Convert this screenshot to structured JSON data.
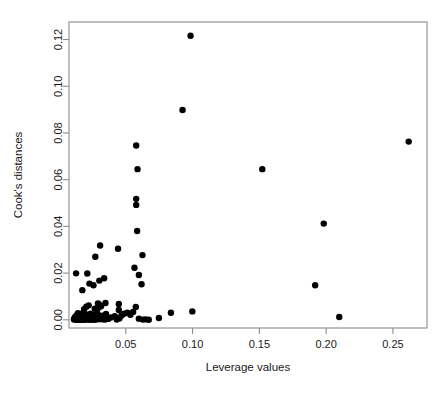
{
  "chart_data": {
    "type": "scatter",
    "title": "",
    "xlabel": "Leverage values",
    "ylabel": "Cook's distances",
    "xlim": [
      0.0075,
      0.2755
    ],
    "ylim": [
      -0.0035,
      0.1275
    ],
    "xticks": [
      0.05,
      0.1,
      0.15,
      0.2,
      0.25
    ],
    "xticklabels": [
      "0.05",
      "0.10",
      "0.15",
      "0.20",
      "0.25"
    ],
    "yticks": [
      0.0,
      0.02,
      0.04,
      0.06,
      0.08,
      0.1,
      0.12
    ],
    "yticklabels": [
      "0.00",
      "0.02",
      "0.04",
      "0.06",
      "0.08",
      "0.10",
      "0.12"
    ],
    "grid": false,
    "legend": null,
    "marker": "filled-circle",
    "marker_color": "#000000",
    "marker_size": 3.2,
    "series": [
      {
        "name": "observations",
        "points": [
          [
            0.0985,
            0.1216
          ],
          [
            0.0925,
            0.0898
          ],
          [
            0.2618,
            0.0763
          ],
          [
            0.0578,
            0.0746
          ],
          [
            0.1522,
            0.0645
          ],
          [
            0.0588,
            0.0645
          ],
          [
            0.0578,
            0.0518
          ],
          [
            0.0578,
            0.0492
          ],
          [
            0.1982,
            0.0412
          ],
          [
            0.0585,
            0.038
          ],
          [
            0.0308,
            0.0318
          ],
          [
            0.0442,
            0.0304
          ],
          [
            0.0625,
            0.0277
          ],
          [
            0.0272,
            0.027
          ],
          [
            0.0565,
            0.0223
          ],
          [
            0.0128,
            0.0199
          ],
          [
            0.0212,
            0.0198
          ],
          [
            0.0598,
            0.0192
          ],
          [
            0.0338,
            0.0178
          ],
          [
            0.0302,
            0.0168
          ],
          [
            0.0228,
            0.0155
          ],
          [
            0.0618,
            0.0152
          ],
          [
            0.0258,
            0.0148
          ],
          [
            0.1918,
            0.0148
          ],
          [
            0.0175,
            0.0127
          ],
          [
            0.0348,
            0.0072
          ],
          [
            0.0292,
            0.007
          ],
          [
            0.0448,
            0.0068
          ],
          [
            0.0302,
            0.0065
          ],
          [
            0.0222,
            0.0062
          ],
          [
            0.0315,
            0.0058
          ],
          [
            0.0205,
            0.0056
          ],
          [
            0.0575,
            0.0055
          ],
          [
            0.0295,
            0.0052
          ],
          [
            0.0268,
            0.0048
          ],
          [
            0.0188,
            0.0046
          ],
          [
            0.0448,
            0.0042
          ],
          [
            0.0998,
            0.0036
          ],
          [
            0.0555,
            0.0034
          ],
          [
            0.0838,
            0.003
          ],
          [
            0.0512,
            0.003
          ],
          [
            0.0285,
            0.0029
          ],
          [
            0.0178,
            0.0028
          ],
          [
            0.0142,
            0.0028
          ],
          [
            0.0488,
            0.0026
          ],
          [
            0.0238,
            0.0026
          ],
          [
            0.0352,
            0.0025
          ],
          [
            0.0162,
            0.0024
          ],
          [
            0.0208,
            0.0023
          ],
          [
            0.0252,
            0.0022
          ],
          [
            0.0535,
            0.0022
          ],
          [
            0.0135,
            0.0021
          ],
          [
            0.0295,
            0.002
          ],
          [
            0.0185,
            0.002
          ],
          [
            0.0468,
            0.0019
          ],
          [
            0.0228,
            0.0018
          ],
          [
            0.0325,
            0.0018
          ],
          [
            0.0155,
            0.0017
          ],
          [
            0.0275,
            0.0016
          ],
          [
            0.0198,
            0.0016
          ],
          [
            0.0128,
            0.0015
          ],
          [
            0.0418,
            0.0015
          ],
          [
            0.0242,
            0.0014
          ],
          [
            0.0172,
            0.0014
          ],
          [
            0.0308,
            0.0013
          ],
          [
            0.0145,
            0.0013
          ],
          [
            0.0215,
            0.0012
          ],
          [
            0.2098,
            0.0012
          ],
          [
            0.0262,
            0.0011
          ],
          [
            0.0348,
            0.0011
          ],
          [
            0.0118,
            0.001
          ],
          [
            0.0192,
            0.001
          ],
          [
            0.0388,
            0.001
          ],
          [
            0.0232,
            0.0009
          ],
          [
            0.0158,
            0.0009
          ],
          [
            0.0285,
            0.0008
          ],
          [
            0.0128,
            0.0008
          ],
          [
            0.0205,
            0.0008
          ],
          [
            0.0748,
            0.0008
          ],
          [
            0.0338,
            0.0007
          ],
          [
            0.0248,
            0.0007
          ],
          [
            0.0142,
            0.0006
          ],
          [
            0.0178,
            0.0006
          ],
          [
            0.0452,
            0.0006
          ],
          [
            0.0295,
            0.0006
          ],
          [
            0.0222,
            0.0005
          ],
          [
            0.0115,
            0.0005
          ],
          [
            0.0165,
            0.0005
          ],
          [
            0.0268,
            0.0005
          ],
          [
            0.0598,
            0.0005
          ],
          [
            0.0318,
            0.0004
          ],
          [
            0.0192,
            0.0004
          ],
          [
            0.0138,
            0.0004
          ],
          [
            0.0238,
            0.0004
          ],
          [
            0.0368,
            0.0004
          ],
          [
            0.0152,
            0.0003
          ],
          [
            0.0212,
            0.0003
          ],
          [
            0.0282,
            0.0003
          ],
          [
            0.0122,
            0.0003
          ],
          [
            0.0258,
            0.0003
          ],
          [
            0.0172,
            0.0002
          ],
          [
            0.0328,
            0.0002
          ],
          [
            0.0198,
            0.0002
          ],
          [
            0.0135,
            0.0002
          ],
          [
            0.0648,
            0.0002
          ],
          [
            0.0225,
            0.0002
          ],
          [
            0.0302,
            0.0002
          ],
          [
            0.0158,
            0.0001
          ],
          [
            0.0182,
            0.0001
          ],
          [
            0.0245,
            0.0001
          ],
          [
            0.0112,
            0.0001
          ],
          [
            0.0432,
            0.0001
          ],
          [
            0.0275,
            0.0001
          ],
          [
            0.0148,
            0.0001
          ],
          [
            0.0205,
            0.0001
          ],
          [
            0.0628,
            0.0001
          ],
          [
            0.0345,
            0.0001
          ],
          [
            0.0128,
            5e-05
          ],
          [
            0.0262,
            5e-05
          ],
          [
            0.0188,
            5e-05
          ],
          [
            0.0672,
            5e-05
          ],
          [
            0.0232,
            3e-05
          ],
          [
            0.0165,
            3e-05
          ],
          [
            0.0142,
            2e-05
          ]
        ]
      }
    ]
  },
  "plot": {
    "frame": {
      "left": 69,
      "top": 22,
      "right": 427,
      "bottom": 328
    },
    "background_color": "#ffffff",
    "frame_color": "#8c8c8c",
    "text_color": "#1a1a1a"
  }
}
